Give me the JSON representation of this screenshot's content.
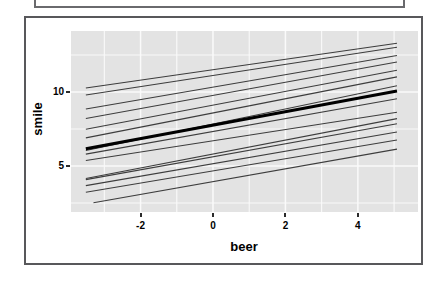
{
  "chart_data": {
    "type": "line",
    "title": "",
    "xlabel": "beer",
    "ylabel": "smile",
    "xlim": [
      -3.92,
      5.66
    ],
    "ylim": [
      1.89,
      14.12
    ],
    "x_tick_values": [
      -2,
      0,
      2,
      4
    ],
    "x_tick_labels": [
      "-2",
      "0",
      "2",
      "4"
    ],
    "y_tick_values": [
      5,
      10
    ],
    "y_tick_labels": [
      "5",
      "10"
    ],
    "x_gridlines": [
      -3,
      -2,
      -1,
      0,
      1,
      2,
      3,
      4,
      5
    ],
    "y_gridlines": [
      2.5,
      5,
      7.5,
      10,
      12.5
    ],
    "grid_on": true,
    "legend": "none",
    "panel_bg": "#e3e3e3",
    "grid_color": "#fafafa",
    "thin_line_color": "#3d3d3d",
    "mean_line_color": "#000000",
    "series": [
      {
        "name": "subject-line-1",
        "x": [
          -3.51,
          5.08
        ],
        "y": [
          10.27,
          13.29
        ],
        "color": "#3d3d3d",
        "width": 1.1
      },
      {
        "name": "subject-line-2",
        "x": [
          -3.51,
          5.08
        ],
        "y": [
          9.8,
          13.02
        ],
        "color": "#3d3d3d",
        "width": 1.1
      },
      {
        "name": "subject-line-3",
        "x": [
          -3.51,
          5.08
        ],
        "y": [
          8.85,
          12.47
        ],
        "color": "#3d3d3d",
        "width": 1.1
      },
      {
        "name": "subject-line-4",
        "x": [
          -3.51,
          5.08
        ],
        "y": [
          8.21,
          12.02
        ],
        "color": "#3d3d3d",
        "width": 1.1
      },
      {
        "name": "subject-line-5",
        "x": [
          -3.51,
          5.08
        ],
        "y": [
          7.48,
          11.47
        ],
        "color": "#3d3d3d",
        "width": 1.1
      },
      {
        "name": "subject-line-6",
        "x": [
          -3.51,
          5.08
        ],
        "y": [
          6.9,
          11.02
        ],
        "color": "#3d3d3d",
        "width": 1.1
      },
      {
        "name": "subject-line-7",
        "x": [
          -3.51,
          5.08
        ],
        "y": [
          6.05,
          10.42
        ],
        "color": "#3d3d3d",
        "width": 1.1
      },
      {
        "name": "subject-line-8",
        "x": [
          -3.51,
          5.08
        ],
        "y": [
          5.8,
          9.54
        ],
        "color": "#3d3d3d",
        "width": 1.1
      },
      {
        "name": "subject-line-9",
        "x": [
          -3.51,
          5.08
        ],
        "y": [
          5.37,
          8.63
        ],
        "color": "#3d3d3d",
        "width": 1.1
      },
      {
        "name": "subject-line-10",
        "x": [
          -3.51,
          5.08
        ],
        "y": [
          4.15,
          8.2
        ],
        "color": "#3d3d3d",
        "width": 1.1
      },
      {
        "name": "subject-line-11",
        "x": [
          -3.51,
          5.08
        ],
        "y": [
          4.08,
          7.85
        ],
        "color": "#3d3d3d",
        "width": 1.1
      },
      {
        "name": "subject-line-12",
        "x": [
          -3.51,
          5.08
        ],
        "y": [
          3.67,
          7.29
        ],
        "color": "#3d3d3d",
        "width": 1.1
      },
      {
        "name": "subject-line-13",
        "x": [
          -3.51,
          5.08
        ],
        "y": [
          3.22,
          6.75
        ],
        "color": "#3d3d3d",
        "width": 1.1
      },
      {
        "name": "subject-line-14",
        "x": [
          -3.3,
          5.08
        ],
        "y": [
          2.51,
          6.14
        ],
        "color": "#3d3d3d",
        "width": 1.1
      },
      {
        "name": "average-line",
        "x": [
          -3.51,
          5.08
        ],
        "y": [
          6.17,
          10.06
        ],
        "color": "#000000",
        "width": 3.0
      }
    ]
  }
}
